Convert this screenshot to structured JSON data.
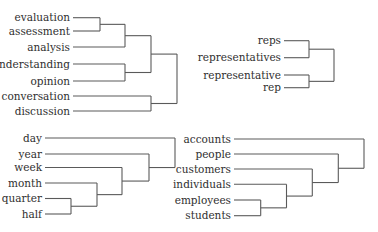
{
  "colors": {
    "line": "#5a5a5a",
    "text": "#2f2f2f",
    "background": "#ffffff"
  },
  "dendrograms": [
    {
      "id": "top-left",
      "label_right_x": 70,
      "line_start_x": 73,
      "leaves": [
        {
          "label": "evaluation",
          "y": 17.7
        },
        {
          "label": "assessment",
          "y": 31
        },
        {
          "label": "analysis",
          "y": 47
        },
        {
          "label": "understanding",
          "y": 64
        },
        {
          "label": "opinion",
          "y": 81
        },
        {
          "label": "conversation",
          "y": 96
        },
        {
          "label": "discussion",
          "y": 111
        }
      ],
      "merges": [
        {
          "a": "L0",
          "b": "L1",
          "x": 100
        },
        {
          "a": "M0",
          "b": "L2",
          "x": 125
        },
        {
          "a": "L3",
          "b": "L4",
          "x": 125
        },
        {
          "a": "M1",
          "b": "M2",
          "x": 151
        },
        {
          "a": "L5",
          "b": "L6",
          "x": 151
        },
        {
          "a": "M3",
          "b": "M4",
          "x": 177
        }
      ]
    },
    {
      "id": "top-right",
      "label_right_x": 281,
      "line_start_x": 284,
      "leaves": [
        {
          "label": "reps",
          "y": 40.7
        },
        {
          "label": "representatives",
          "y": 57.7
        },
        {
          "label": "representative",
          "y": 75
        },
        {
          "label": "rep",
          "y": 87.7
        }
      ],
      "merges": [
        {
          "a": "L0",
          "b": "L1",
          "x": 309
        },
        {
          "a": "L2",
          "b": "L3",
          "x": 309
        },
        {
          "a": "M0",
          "b": "M1",
          "x": 334
        }
      ]
    },
    {
      "id": "bottom-left",
      "label_right_x": 42,
      "line_start_x": 45,
      "leaves": [
        {
          "label": "day",
          "y": 138
        },
        {
          "label": "year",
          "y": 154
        },
        {
          "label": "week",
          "y": 167.5
        },
        {
          "label": "month",
          "y": 183
        },
        {
          "label": "quarter",
          "y": 198.5
        },
        {
          "label": "half",
          "y": 214
        }
      ],
      "merges": [
        {
          "a": "L4",
          "b": "L5",
          "x": 71
        },
        {
          "a": "L3",
          "b": "M0",
          "x": 97
        },
        {
          "a": "L2",
          "b": "M1",
          "x": 122
        },
        {
          "a": "L1",
          "b": "M2",
          "x": 149
        },
        {
          "a": "L0",
          "b": "M3",
          "x": 175
        }
      ]
    },
    {
      "id": "bottom-right",
      "label_right_x": 231,
      "line_start_x": 234,
      "leaves": [
        {
          "label": "accounts",
          "y": 139
        },
        {
          "label": "people",
          "y": 154
        },
        {
          "label": "customers",
          "y": 169
        },
        {
          "label": "individuals",
          "y": 184.3
        },
        {
          "label": "employees",
          "y": 200
        },
        {
          "label": "students",
          "y": 215.7
        }
      ],
      "merges": [
        {
          "a": "L4",
          "b": "L5",
          "x": 260.7
        },
        {
          "a": "L3",
          "b": "M0",
          "x": 286.5
        },
        {
          "a": "L2",
          "b": "M1",
          "x": 312.3
        },
        {
          "a": "L1",
          "b": "M2",
          "x": 338.3
        },
        {
          "a": "L0",
          "b": "M3",
          "x": 364
        }
      ]
    }
  ]
}
